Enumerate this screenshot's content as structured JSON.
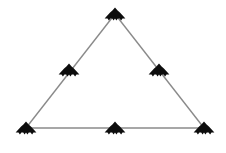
{
  "figure": {
    "background_color": "#ffffff",
    "width": 226,
    "height": 153
  },
  "style": {
    "edge_color": "#8a8a8a",
    "edge_width": 1.4,
    "node_color": "#0d0d0d",
    "node_icon": "stealth-aircraft-icon",
    "node_width": 21,
    "node_height": 13
  },
  "chart_data": {
    "type": "scatter",
    "xlabel": "",
    "ylabel": "",
    "xlim": [
      0,
      226
    ],
    "ylim": [
      0,
      153
    ],
    "grid": false,
    "legend": "none",
    "vertices": [
      {
        "id": "apex",
        "label": "top-vertex",
        "x": 115,
        "y": 14
      },
      {
        "id": "bottom-left",
        "label": "bottom-left-vertex",
        "x": 26,
        "y": 128
      },
      {
        "id": "bottom-right",
        "label": "bottom-right-vertex",
        "x": 204,
        "y": 128
      }
    ],
    "midpoints": [
      {
        "id": "left-mid",
        "label": "left-edge-midpoint",
        "x": 69,
        "y": 70
      },
      {
        "id": "right-mid",
        "label": "right-edge-midpoint",
        "x": 159,
        "y": 70
      },
      {
        "id": "bottom-mid",
        "label": "bottom-edge-midpoint",
        "x": 115,
        "y": 128
      }
    ],
    "edges": [
      {
        "id": "left-edge",
        "label": "left-edge",
        "from": "bottom-left",
        "to": "apex"
      },
      {
        "id": "right-edge",
        "label": "right-edge",
        "from": "apex",
        "to": "bottom-right"
      },
      {
        "id": "bottom-edge",
        "label": "bottom-edge",
        "from": "bottom-left",
        "to": "bottom-right"
      }
    ],
    "node_count": 6,
    "edge_count": 3
  }
}
